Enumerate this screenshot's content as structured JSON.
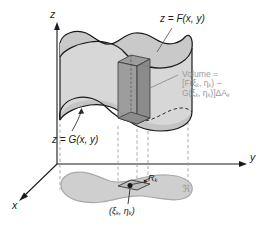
{
  "figure": {
    "title_internal": "volume-between-two-surfaces-over-region-R",
    "axes": {
      "z_label": "z",
      "y_label": "y",
      "x_label": "x"
    },
    "labels": {
      "top_surface": "z = F(x, y)",
      "bottom_surface": "z = G(x, y)",
      "volume_line1": "Volume =",
      "volume_line2_pre": "[F(",
      "volume_line2_xi": "ξ",
      "volume_line2_k1": "k",
      "volume_line2_mid": ", ",
      "volume_line2_eta": "η",
      "volume_line2_k2": "k",
      "volume_line2_post": ") −",
      "volume_line3_pre": "G(",
      "volume_line3_post": ")]ΔA",
      "subcell": "R",
      "subcell_sub": "k",
      "region": "ℜ",
      "sample_point": "(ξ",
      "sample_point_mid": ", η",
      "sample_point_end": ")"
    },
    "colors": {
      "stroke_dark": "#1a1a1a",
      "surface_fill": "#c9c9c9",
      "body_fill": "#d4d4d4",
      "prism_fill": "#a8a8a8",
      "prism_fill_dark": "#8f8f8f",
      "region_fill": "#cfcfcf",
      "region_stroke": "#a9a9a9",
      "annotation_gray": "#9a9a9a",
      "dash_gray": "#9b9b9b",
      "leader_gray": "#8a8a8a"
    }
  }
}
